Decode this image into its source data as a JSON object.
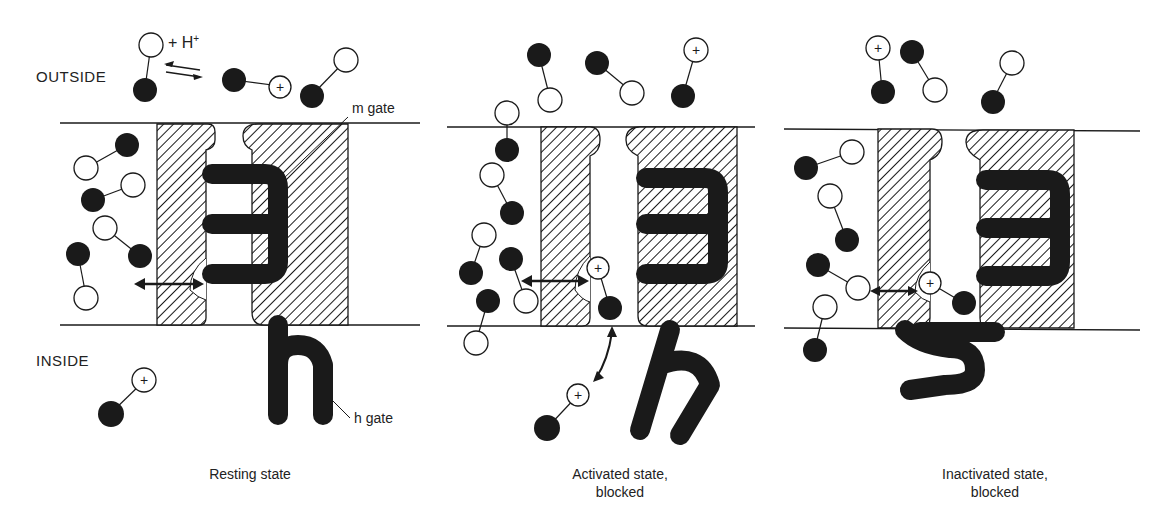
{
  "figure": {
    "labels": {
      "outside": "OUTSIDE",
      "inside": "INSIDE",
      "m_gate": "m gate",
      "h_gate": "h gate",
      "proton": "+ H",
      "proton_charge": "+"
    },
    "panels": [
      {
        "id": "resting",
        "caption_line1": "Resting state",
        "caption_line2": ""
      },
      {
        "id": "activated",
        "caption_line1": "Activated state,",
        "caption_line2": "blocked"
      },
      {
        "id": "inactivated",
        "caption_line1": "Inactivated state,",
        "caption_line2": "blocked"
      }
    ],
    "legend_symbols": {
      "filled_circle": "drug-molecule-part",
      "open_circle": "drug-molecule-part",
      "plus_circle": "charged-form"
    },
    "colors": {
      "ink": "#1a1a1a",
      "background": "#ffffff"
    }
  }
}
